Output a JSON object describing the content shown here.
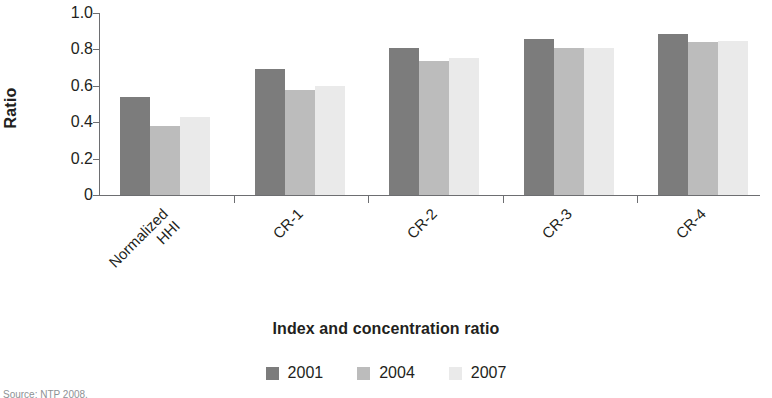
{
  "chart_data": {
    "type": "bar",
    "title": "",
    "xlabel": "Index and concentration ratio",
    "ylabel": "Ratio",
    "categories": [
      "Normalized HHI",
      "CR-1",
      "CR-2",
      "CR-3",
      "CR-4"
    ],
    "category_lines": [
      [
        "Normalized",
        "HHI"
      ],
      [
        "CR-1"
      ],
      [
        "CR-2"
      ],
      [
        "CR-3"
      ],
      [
        "CR-4"
      ]
    ],
    "series": [
      {
        "name": "2001",
        "color": "#7c7c7c",
        "values": [
          0.54,
          0.69,
          0.81,
          0.855,
          0.885
        ]
      },
      {
        "name": "2004",
        "color": "#bcbcbc",
        "values": [
          0.38,
          0.575,
          0.735,
          0.81,
          0.84
        ]
      },
      {
        "name": "2007",
        "color": "#eaeaea",
        "values": [
          0.43,
          0.6,
          0.755,
          0.81,
          0.845
        ]
      }
    ],
    "ylim": [
      0,
      1.0
    ],
    "yticks": [
      1.0,
      0.8,
      0.6,
      0.4,
      0.2,
      0
    ],
    "ytick_labels": [
      "1.0",
      "0.8",
      "0.6",
      "0.4",
      "0.2",
      "0"
    ],
    "grid": false,
    "legend_position": "bottom"
  },
  "source_note": "Source: NTP 2008."
}
